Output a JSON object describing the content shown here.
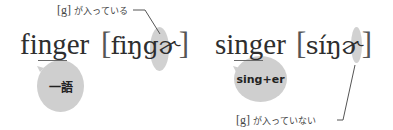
{
  "left": {
    "word": {
      "pre": "fi",
      "underlined": "ng",
      "post": "er"
    },
    "ipa": {
      "open": "[",
      "body": "fiŋ",
      "highlight": "g",
      "tail": "ɚ",
      "close": "]"
    },
    "bubble_label": "一語",
    "note": {
      "bracket": "[g]",
      "text": "が入っている"
    }
  },
  "right": {
    "word": {
      "pre": "si",
      "underlined": "ng",
      "post": "er"
    },
    "ipa": {
      "open": "[",
      "body": "síŋ",
      "tail": "ɚ",
      "close": "]"
    },
    "bubble_label": "sing+er",
    "note": {
      "bracket": "[g]",
      "text": "が入っていない"
    }
  },
  "colors": {
    "bubble": "#cfcfcf",
    "text": "#2e2e2e",
    "line": "#555555"
  }
}
